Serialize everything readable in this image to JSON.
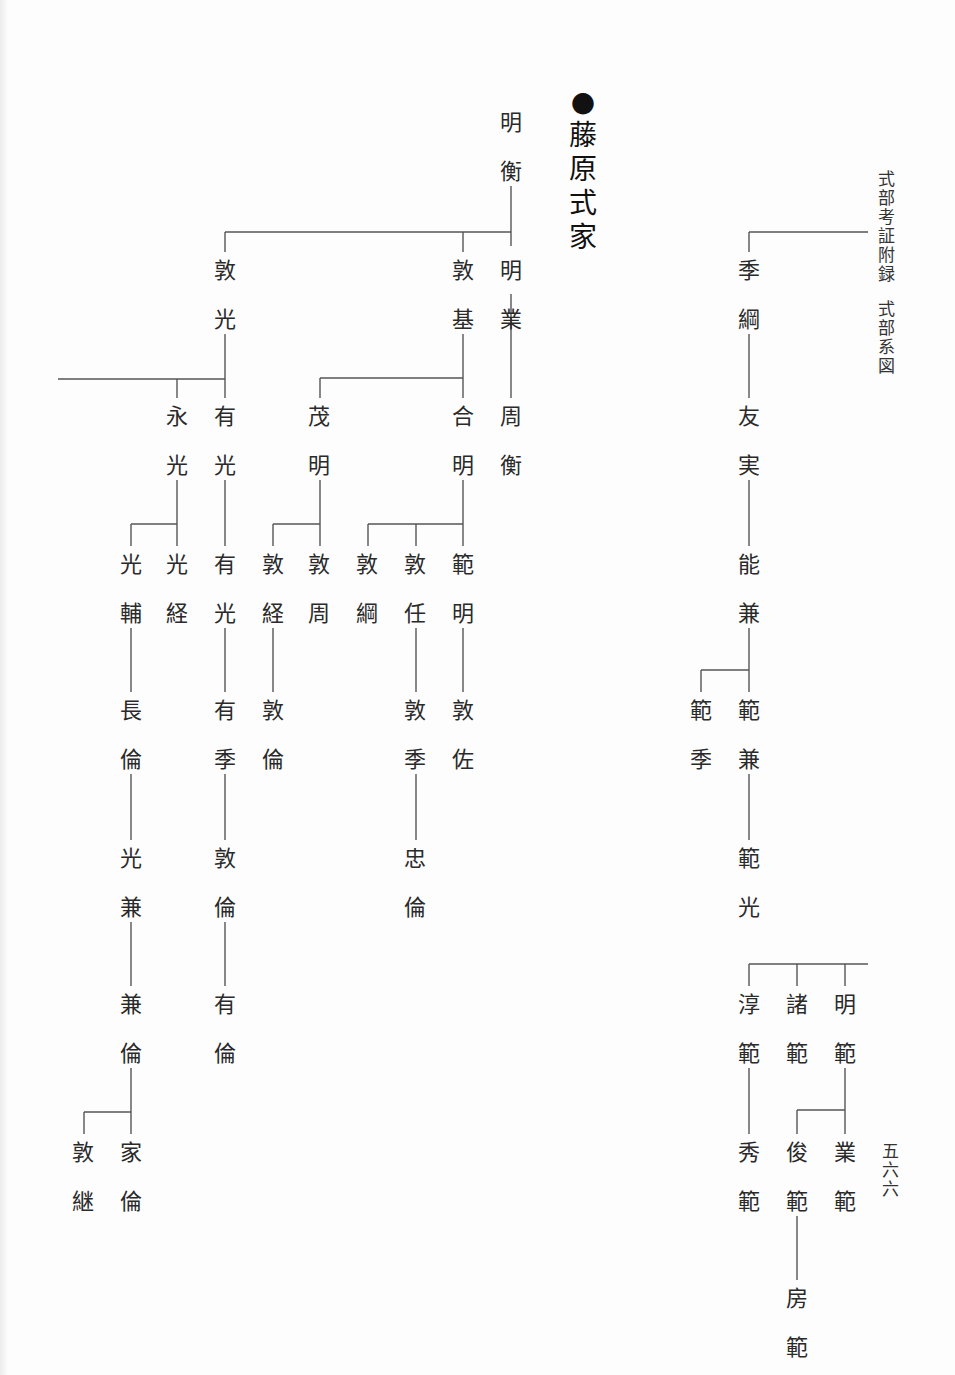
{
  "header": {
    "running_title": [
      "式",
      "部",
      "考",
      "証",
      "附",
      "録"
    ],
    "section_title": [
      "式",
      "部",
      "系",
      "図"
    ]
  },
  "title": {
    "bullet": "●",
    "family_name": [
      "藤",
      "原",
      "式",
      "家"
    ]
  },
  "page_number": [
    "五",
    "六",
    "六"
  ],
  "line_color": "#555555",
  "names": [
    {
      "id": "akihira",
      "chars": [
        "明",
        "衡"
      ],
      "x": 496,
      "y": 98
    },
    {
      "id": "atsumitsu",
      "chars": [
        "敦",
        "光"
      ],
      "x": 210,
      "y": 246
    },
    {
      "id": "atsumoto",
      "chars": [
        "敦",
        "基"
      ],
      "x": 448,
      "y": 246
    },
    {
      "id": "akinari",
      "chars": [
        "明",
        "業"
      ],
      "x": 496,
      "y": 246
    },
    {
      "id": "nagamitsu",
      "chars": [
        "永",
        "光"
      ],
      "x": 162,
      "y": 392
    },
    {
      "id": "arimitsu",
      "chars": [
        "有",
        "光"
      ],
      "x": 210,
      "y": 392
    },
    {
      "id": "shigeaki",
      "chars": [
        "茂",
        "明"
      ],
      "x": 304,
      "y": 392
    },
    {
      "id": "yoshiaki",
      "chars": [
        "合",
        "明"
      ],
      "x": 448,
      "y": 392
    },
    {
      "id": "chikahira",
      "chars": [
        "周",
        "衡"
      ],
      "x": 496,
      "y": 392
    },
    {
      "id": "mitsusuke",
      "chars": [
        "光",
        "輔"
      ],
      "x": 116,
      "y": 540
    },
    {
      "id": "mitsutsune",
      "chars": [
        "光",
        "経"
      ],
      "x": 162,
      "y": 540
    },
    {
      "id": "arimitsu2",
      "chars": [
        "有",
        "光"
      ],
      "x": 210,
      "y": 540
    },
    {
      "id": "atsutsune",
      "chars": [
        "敦",
        "経"
      ],
      "x": 258,
      "y": 540
    },
    {
      "id": "atsuchika",
      "chars": [
        "敦",
        "周"
      ],
      "x": 304,
      "y": 540
    },
    {
      "id": "atsutsuna",
      "chars": [
        "敦",
        "綱"
      ],
      "x": 352,
      "y": 540
    },
    {
      "id": "atsutada",
      "chars": [
        "敦",
        "任"
      ],
      "x": 400,
      "y": 540
    },
    {
      "id": "noriaki",
      "chars": [
        "範",
        "明"
      ],
      "x": 448,
      "y": 540
    },
    {
      "id": "naganori",
      "chars": [
        "長",
        "倫"
      ],
      "x": 116,
      "y": 686
    },
    {
      "id": "arisue",
      "chars": [
        "有",
        "季"
      ],
      "x": 210,
      "y": 686
    },
    {
      "id": "atsunori1",
      "chars": [
        "敦",
        "倫"
      ],
      "x": 258,
      "y": 686
    },
    {
      "id": "atsusue",
      "chars": [
        "敦",
        "季"
      ],
      "x": 400,
      "y": 686
    },
    {
      "id": "atsusuke",
      "chars": [
        "敦",
        "佐"
      ],
      "x": 448,
      "y": 686
    },
    {
      "id": "mitsukane",
      "chars": [
        "光",
        "兼"
      ],
      "x": 116,
      "y": 834
    },
    {
      "id": "atsunori2",
      "chars": [
        "敦",
        "倫"
      ],
      "x": 210,
      "y": 834
    },
    {
      "id": "tadanori",
      "chars": [
        "忠",
        "倫"
      ],
      "x": 400,
      "y": 834
    },
    {
      "id": "kanenori",
      "chars": [
        "兼",
        "倫"
      ],
      "x": 116,
      "y": 980
    },
    {
      "id": "arinori",
      "chars": [
        "有",
        "倫"
      ],
      "x": 210,
      "y": 980
    },
    {
      "id": "atsutsugu",
      "chars": [
        "敦",
        "継"
      ],
      "x": 68,
      "y": 1128
    },
    {
      "id": "ienori",
      "chars": [
        "家",
        "倫"
      ],
      "x": 116,
      "y": 1128
    },
    {
      "id": "suetsuna",
      "chars": [
        "季",
        "綱"
      ],
      "x": 734,
      "y": 246
    },
    {
      "id": "tomozane",
      "chars": [
        "友",
        "実"
      ],
      "x": 734,
      "y": 392
    },
    {
      "id": "yoshikane",
      "chars": [
        "能",
        "兼"
      ],
      "x": 734,
      "y": 540
    },
    {
      "id": "norisue",
      "chars": [
        "範",
        "季"
      ],
      "x": 686,
      "y": 686
    },
    {
      "id": "norikane",
      "chars": [
        "範",
        "兼"
      ],
      "x": 734,
      "y": 686
    },
    {
      "id": "norimitsu",
      "chars": [
        "範",
        "光"
      ],
      "x": 734,
      "y": 834
    },
    {
      "id": "atsunori3",
      "chars": [
        "淳",
        "範"
      ],
      "x": 734,
      "y": 980
    },
    {
      "id": "moronori",
      "chars": [
        "諸",
        "範"
      ],
      "x": 782,
      "y": 980
    },
    {
      "id": "akinori",
      "chars": [
        "明",
        "範"
      ],
      "x": 830,
      "y": 980
    },
    {
      "id": "hidenori",
      "chars": [
        "秀",
        "範"
      ],
      "x": 734,
      "y": 1128
    },
    {
      "id": "toshinori",
      "chars": [
        "俊",
        "範"
      ],
      "x": 782,
      "y": 1128
    },
    {
      "id": "narinori",
      "chars": [
        "業",
        "範"
      ],
      "x": 830,
      "y": 1128
    },
    {
      "id": "fusanori",
      "chars": [
        "房",
        "範"
      ],
      "x": 782,
      "y": 1274
    }
  ],
  "lines": [
    [
      511,
      186,
      511,
      246
    ],
    [
      225,
      232,
      511,
      232
    ],
    [
      225,
      232,
      225,
      252
    ],
    [
      463,
      232,
      463,
      252
    ],
    [
      511,
      294,
      511,
      398
    ],
    [
      225,
      334,
      225,
      398
    ],
    [
      58,
      379,
      225,
      379
    ],
    [
      177,
      379,
      177,
      398
    ],
    [
      463,
      334,
      463,
      398
    ],
    [
      320,
      378,
      463,
      378
    ],
    [
      320,
      378,
      320,
      398
    ],
    [
      177,
      480,
      177,
      546
    ],
    [
      131,
      524,
      177,
      524
    ],
    [
      131,
      524,
      131,
      546
    ],
    [
      225,
      480,
      225,
      546
    ],
    [
      320,
      480,
      320,
      546
    ],
    [
      273,
      524,
      320,
      524
    ],
    [
      273,
      524,
      273,
      546
    ],
    [
      463,
      480,
      463,
      546
    ],
    [
      368,
      524,
      463,
      524
    ],
    [
      368,
      524,
      368,
      546
    ],
    [
      416,
      524,
      416,
      546
    ],
    [
      131,
      628,
      131,
      692
    ],
    [
      225,
      628,
      225,
      692
    ],
    [
      273,
      628,
      273,
      692
    ],
    [
      416,
      628,
      416,
      692
    ],
    [
      463,
      628,
      463,
      692
    ],
    [
      131,
      774,
      131,
      840
    ],
    [
      225,
      774,
      225,
      840
    ],
    [
      416,
      774,
      416,
      840
    ],
    [
      131,
      922,
      131,
      986
    ],
    [
      225,
      922,
      225,
      986
    ],
    [
      131,
      1068,
      131,
      1134
    ],
    [
      84,
      1112,
      131,
      1112
    ],
    [
      84,
      1112,
      84,
      1134
    ],
    [
      749,
      232,
      868,
      232
    ],
    [
      749,
      232,
      749,
      252
    ],
    [
      749,
      334,
      749,
      398
    ],
    [
      749,
      480,
      749,
      546
    ],
    [
      749,
      628,
      749,
      692
    ],
    [
      701,
      670,
      749,
      670
    ],
    [
      701,
      670,
      701,
      692
    ],
    [
      749,
      774,
      749,
      840
    ],
    [
      749,
      964,
      868,
      964
    ],
    [
      749,
      964,
      749,
      986
    ],
    [
      797,
      964,
      797,
      986
    ],
    [
      845,
      964,
      845,
      986
    ],
    [
      749,
      1068,
      749,
      1134
    ],
    [
      845,
      1068,
      845,
      1134
    ],
    [
      797,
      1110,
      845,
      1110
    ],
    [
      797,
      1110,
      797,
      1134
    ],
    [
      797,
      1216,
      797,
      1280
    ]
  ]
}
